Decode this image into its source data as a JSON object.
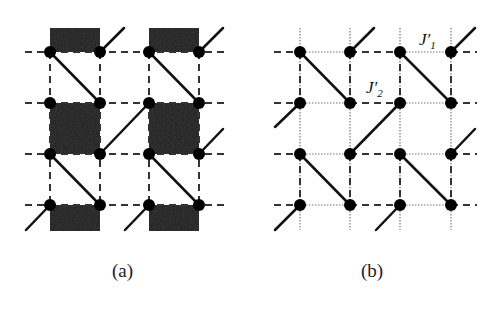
{
  "figure": {
    "panels": [
      {
        "id": "a",
        "caption": "(a)",
        "node_x": [
          50,
          100,
          149,
          199
        ],
        "node_y": [
          52,
          103,
          154,
          205
        ],
        "description": "Lattice with dashed bonds, solid diagonal bonds and shaded plaquettes"
      },
      {
        "id": "b",
        "caption": "(b)",
        "node_x": [
          300,
          350,
          400,
          451
        ],
        "node_y": [
          52,
          103,
          154,
          205
        ],
        "description": "Lattice with dashed and dotted bonds and solid diagonal bonds",
        "labels": {
          "j1": "J′",
          "j1_sub": "1",
          "j2": "J′",
          "j2_sub": "2"
        }
      }
    ],
    "colors": {
      "line": "#111111",
      "shade": "#1c1c1c",
      "dotted": "#777777"
    }
  }
}
